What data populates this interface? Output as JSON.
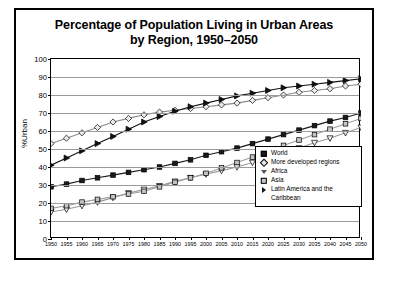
{
  "chart_data": {
    "type": "line",
    "title": "Percentage of Population Living in Urban Areas by Region, 1950–2050",
    "title_line1": "Percentage of Population Living in Urban Areas",
    "title_line2": "by Region, 1950–2050",
    "xlabel": "",
    "ylabel": "%Urban",
    "ylim": [
      0,
      100
    ],
    "xlim": [
      1950,
      2050
    ],
    "ytick_step": 10,
    "xtick_step": 5,
    "grid": "horizontal",
    "legend_position": "bottom-right",
    "yticks": [
      "0",
      "10",
      "20",
      "30",
      "40",
      "50",
      "60",
      "70",
      "80",
      "90",
      "100"
    ],
    "x": [
      1950,
      1955,
      1960,
      1965,
      1970,
      1975,
      1980,
      1985,
      1990,
      1995,
      2000,
      2005,
      2010,
      2015,
      2020,
      2025,
      2030,
      2035,
      2040,
      2045,
      2050
    ],
    "xticks": [
      "1950",
      "1955",
      "1960",
      "1965",
      "1970",
      "1975",
      "1980",
      "1985",
      "1990",
      "1995",
      "2000",
      "2005",
      "2010",
      "2015",
      "2020",
      "2025",
      "2030",
      "2035",
      "2040",
      "2045",
      "2050"
    ],
    "series": [
      {
        "name": "World",
        "marker": "filled-square",
        "color": "#1a1a1a",
        "values": [
          29.0,
          30.5,
          32.5,
          34.0,
          35.5,
          37.0,
          38.5,
          40.0,
          42.0,
          44.0,
          46.5,
          48.5,
          50.5,
          53.0,
          55.5,
          58.0,
          60.5,
          63.0,
          65.5,
          67.5,
          70.0
        ]
      },
      {
        "name": "More developed regions",
        "marker": "open-diamond",
        "color": "#8a8a8a",
        "values": [
          53.0,
          56.0,
          59.0,
          62.0,
          65.0,
          67.0,
          69.0,
          70.5,
          71.5,
          72.5,
          73.5,
          74.5,
          75.5,
          77.0,
          78.5,
          80.0,
          81.5,
          82.5,
          83.5,
          85.0,
          86.0
        ]
      },
      {
        "name": "Africa",
        "marker": "open-inverted-triangle",
        "color": "#999999",
        "values": [
          15.0,
          16.5,
          18.5,
          20.5,
          23.0,
          25.5,
          27.5,
          29.5,
          32.0,
          34.0,
          36.0,
          38.0,
          40.0,
          42.5,
          45.0,
          48.0,
          50.5,
          53.5,
          56.0,
          59.0,
          62.0
        ]
      },
      {
        "name": "Asia",
        "marker": "shaded-square",
        "color": "#9e9e9e",
        "values": [
          17.0,
          18.5,
          20.5,
          22.0,
          23.5,
          25.0,
          26.5,
          29.0,
          31.5,
          34.0,
          36.5,
          39.5,
          42.5,
          45.5,
          48.5,
          52.0,
          55.0,
          58.0,
          61.0,
          64.0,
          67.0
        ]
      },
      {
        "name": "Latin America and the Caribbean",
        "marker": "filled-right-triangle",
        "color": "#111111",
        "values": [
          41.0,
          45.0,
          49.0,
          53.0,
          57.0,
          61.0,
          65.0,
          68.0,
          71.0,
          73.5,
          75.5,
          77.5,
          79.5,
          81.0,
          82.5,
          84.0,
          85.0,
          86.0,
          87.0,
          88.0,
          89.0
        ]
      }
    ]
  },
  "legend": {
    "items": [
      {
        "label": "World"
      },
      {
        "label": "More developed regions"
      },
      {
        "label": "Africa"
      },
      {
        "label": "Asia"
      },
      {
        "label": "Latin America and the Caribbean"
      }
    ]
  }
}
